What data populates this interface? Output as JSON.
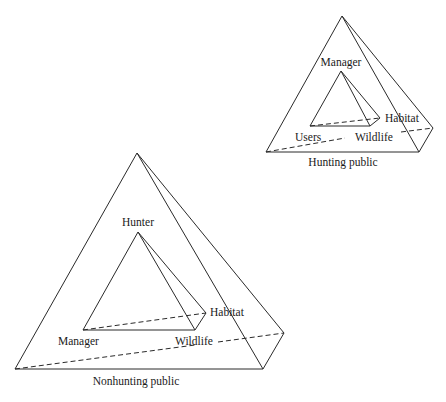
{
  "diagrams": [
    {
      "id": "hunting",
      "outer_label": "Hunting public",
      "inner_labels": {
        "apex": "Manager",
        "left": "Users",
        "right": "Wildlife",
        "back": "Habitat"
      }
    },
    {
      "id": "nonhunting",
      "outer_label": "Nonhunting public",
      "inner_labels": {
        "apex": "Hunter",
        "left": "Manager",
        "right": "Wildlife",
        "back": "Habitat"
      }
    }
  ],
  "colors": {
    "line": "#2a2a2a",
    "text": "#1a1a1a",
    "background": "#ffffff"
  }
}
